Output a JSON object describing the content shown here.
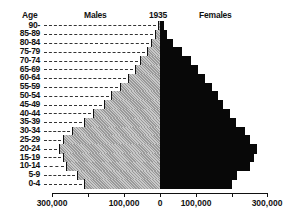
{
  "chart_data": {
    "type": "bar",
    "subtype": "population-pyramid",
    "title": "1935",
    "ylabel": "Age",
    "series_labels": {
      "left": "Males",
      "right": "Females"
    },
    "categories": [
      "90-",
      "85-89",
      "80-84",
      "75-79",
      "70-74",
      "65-69",
      "60-64",
      "55-59",
      "50-54",
      "45-49",
      "40-44",
      "35-39",
      "30-34",
      "25-29",
      "20-24",
      "15-19",
      "10-14",
      "5-9",
      "0-4"
    ],
    "series": [
      {
        "name": "Males",
        "values": [
          5000,
          15000,
          25000,
          35000,
          55000,
          70000,
          90000,
          110000,
          135000,
          155000,
          185000,
          210000,
          245000,
          270000,
          280000,
          270000,
          260000,
          230000,
          210000
        ]
      },
      {
        "name": "Females",
        "values": [
          10000,
          20000,
          35000,
          60000,
          85000,
          105000,
          125000,
          145000,
          160000,
          175000,
          195000,
          210000,
          235000,
          250000,
          270000,
          260000,
          250000,
          215000,
          200000
        ]
      }
    ],
    "xlim": [
      -300000,
      300000
    ],
    "xticks": [
      "300,000",
      "100,000",
      "0",
      "100,000",
      "300,000"
    ],
    "grid": false,
    "legend": "labels above each side",
    "colors": {
      "males": "#b0b0b0",
      "females": "#080808"
    }
  }
}
